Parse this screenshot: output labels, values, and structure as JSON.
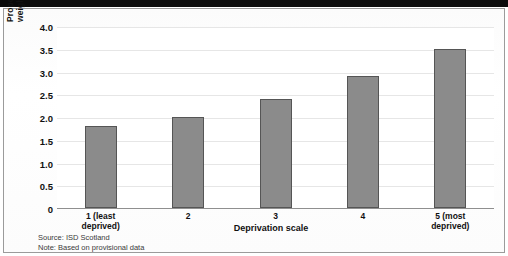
{
  "chart_data": {
    "type": "bar",
    "title": "",
    "subtitle": "",
    "categories": [
      "1 (least deprived)",
      "2",
      "3",
      "4",
      "5 (most deprived)"
    ],
    "category_lines": [
      [
        "1 (least",
        "deprived)"
      ],
      [
        "2"
      ],
      [
        "3"
      ],
      [
        "4"
      ],
      [
        "5 (most",
        "deprived)"
      ]
    ],
    "values": [
      1.8,
      2.0,
      2.4,
      2.9,
      3.5
    ],
    "xlabel": "Deprivation scale",
    "ylabel": "Proportion of births which are of low birth weight by deprivation category (per cent)",
    "ylabel_lines": [
      "Proportion of births which are of low birth",
      "weight by deprivation category (per cent)"
    ],
    "ylim": [
      0,
      4.0
    ],
    "yticks": [
      "4.0",
      "3.5",
      "3.0",
      "2.5",
      "2.0",
      "1.5",
      "1.0",
      "0.5",
      "0"
    ],
    "ytick_values": [
      4.0,
      3.5,
      3.0,
      2.5,
      2.0,
      1.5,
      1.0,
      0.5,
      0
    ],
    "grid": true,
    "legend": "none",
    "bar_color": "#8b8b8b",
    "bar_border_color": "#555555",
    "gridline_color": "#e6e6e6",
    "background_color": "#ffffff"
  },
  "footer": {
    "source": "Source: ISD Scotland",
    "note": "Note: Based on provisional data"
  }
}
